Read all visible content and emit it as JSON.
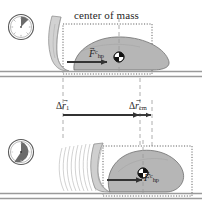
{
  "figure": {
    "title": "center of mass",
    "background": "#ffffff",
    "ink": "#1f1f1f",
    "body_fill": "#b6b6b6",
    "body_stroke": "#6e6e6e",
    "ground_color": "#9a9a9a",
    "dotted_box_color": "#4d4d4d",
    "dashed_guide_color": "#9a9a9a",
    "arrow_color": "#333333"
  },
  "labels": {
    "center_of_mass": "center of mass",
    "force_top": {
      "symbol": "F",
      "superscript": "c",
      "subscript": "hp",
      "vector": true
    },
    "force_bottom": {
      "symbol": "F",
      "superscript": "c",
      "subscript": "hp",
      "vector": true
    },
    "displacement_1": {
      "delta": "Δ",
      "symbol": "r",
      "subscript": "1",
      "vector": true
    },
    "displacement_cm": {
      "delta": "Δ",
      "symbol": "r",
      "subscript": "cm",
      "vector": true
    }
  },
  "panels": [
    {
      "name": "top-panel",
      "clock": {
        "name": "clock-early",
        "fill_fraction": 0.12,
        "start_angle_deg": -90
      },
      "ground_y": 74,
      "body": {
        "cx": 116,
        "cy": 54,
        "label": "hippo-body-initial"
      },
      "com_marker": {
        "x": 119,
        "y": 57,
        "name": "center-of-mass-marker"
      },
      "force_arrow": {
        "x1": 67,
        "y1": 62,
        "x2": 108,
        "y2": 62
      },
      "dotted_box": {
        "x": 63,
        "y": 24,
        "w": 89,
        "h": 50
      }
    },
    {
      "name": "bottom-panel",
      "clock": {
        "name": "clock-later",
        "fill_fraction": 0.42,
        "start_angle_deg": -90
      },
      "ground_y": 196,
      "body": {
        "cx": 140,
        "cy": 166,
        "label": "hippo-body-final"
      },
      "com_marker": {
        "x": 143,
        "y": 173,
        "name": "center-of-mass-marker"
      },
      "force_arrow": {
        "x1": 107,
        "y1": 180,
        "x2": 143,
        "y2": 180
      },
      "dotted_box": {
        "x": 103,
        "y": 146,
        "w": 89,
        "h": 50
      },
      "compression_lines": 9
    }
  ],
  "measurements": {
    "dr1_arrow": {
      "x1": 63,
      "x2": 140,
      "y": 115
    },
    "drcm_arrow": {
      "x1": 131,
      "x2": 152,
      "y": 115
    },
    "guides": [
      {
        "name": "guide-initial-contact",
        "x": 63,
        "y1": 78,
        "y2": 138
      },
      {
        "name": "guide-final-contact",
        "x": 140,
        "y1": 78,
        "y2": 145
      },
      {
        "name": "guide-com-initial",
        "x": 119,
        "y1": 18,
        "y2": 74
      },
      {
        "name": "guide-com-final",
        "x": 143,
        "y1": 140,
        "y2": 196
      },
      {
        "name": "guide-com-shift",
        "x": 152,
        "y1": 100,
        "y2": 145
      }
    ]
  }
}
